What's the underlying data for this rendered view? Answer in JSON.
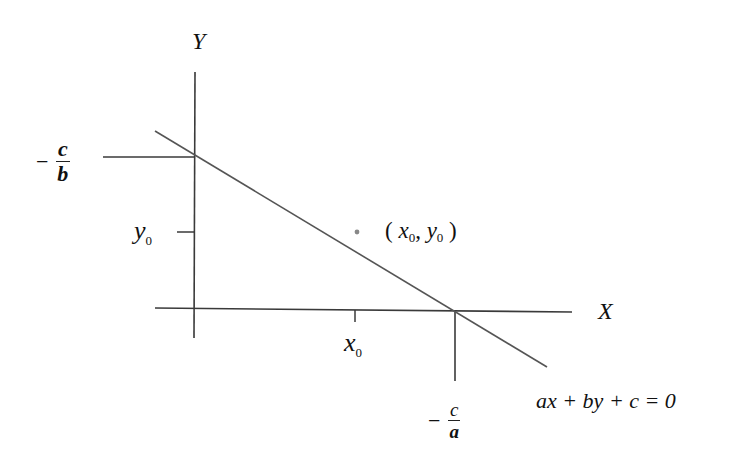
{
  "diagram": {
    "type": "line-with-intercepts",
    "axes": {
      "x_label": "X",
      "y_label": "Y"
    },
    "line_equation": {
      "text": "ax + by + c = 0",
      "parts": [
        "a",
        "x",
        "+",
        "b",
        "y",
        "+",
        "c",
        "=",
        "0"
      ]
    },
    "y_intercept_label": {
      "sign": "−",
      "numerator": "c",
      "denominator": "b"
    },
    "x_intercept_label": {
      "sign": "−",
      "numerator": "c",
      "denominator": "a"
    },
    "point_label": {
      "open": "(",
      "x": "x",
      "x_sub": "0",
      "comma": ",",
      "y": "y",
      "y_sub": "0",
      "close": ")"
    },
    "x0_tick_label": {
      "var": "x",
      "sub": "0"
    },
    "y0_tick_label": {
      "var": "y",
      "sub": "0"
    },
    "colors": {
      "axis": "#3a3a3a",
      "line": "#555555",
      "point": "#888888",
      "text": "#111111"
    }
  }
}
